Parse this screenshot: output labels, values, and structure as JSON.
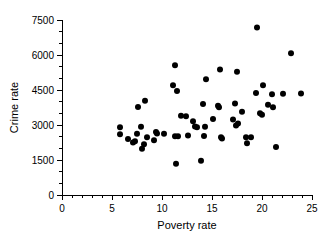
{
  "chart_data": {
    "type": "scatter",
    "title": "",
    "xlabel": "Poverty rate",
    "ylabel": "Crime rate",
    "xlim": [
      0,
      25
    ],
    "ylim": [
      0,
      7500
    ],
    "x_ticks": [
      0,
      5,
      10,
      15,
      20,
      25
    ],
    "y_ticks": [
      0,
      1500,
      3000,
      4500,
      6000,
      7500
    ],
    "x_tick_labels": [
      "0",
      "5",
      "10",
      "15",
      "20",
      "25"
    ],
    "y_tick_labels": [
      "0",
      "1500",
      "3000",
      "4500",
      "6000",
      "7500"
    ],
    "x_minor_tick_step": 1,
    "y_minor_tick_step": 500,
    "grid": false,
    "legend": false,
    "marker": "filled-circle",
    "marker_color": "#000000",
    "marker_size": 3,
    "points": [
      {
        "x": 5.8,
        "y": 2900
      },
      {
        "x": 5.8,
        "y": 2600
      },
      {
        "x": 6.6,
        "y": 2400
      },
      {
        "x": 7.1,
        "y": 2250
      },
      {
        "x": 7.3,
        "y": 2300
      },
      {
        "x": 7.5,
        "y": 2620
      },
      {
        "x": 7.6,
        "y": 3770
      },
      {
        "x": 7.9,
        "y": 2930
      },
      {
        "x": 8.0,
        "y": 1980
      },
      {
        "x": 8.2,
        "y": 2180
      },
      {
        "x": 8.3,
        "y": 4040
      },
      {
        "x": 8.5,
        "y": 2480
      },
      {
        "x": 9.2,
        "y": 2350
      },
      {
        "x": 9.4,
        "y": 2700
      },
      {
        "x": 9.5,
        "y": 2640
      },
      {
        "x": 10.2,
        "y": 2620
      },
      {
        "x": 11.1,
        "y": 4700
      },
      {
        "x": 11.3,
        "y": 5560
      },
      {
        "x": 11.3,
        "y": 2520
      },
      {
        "x": 11.4,
        "y": 1340
      },
      {
        "x": 11.5,
        "y": 4460
      },
      {
        "x": 11.6,
        "y": 2520
      },
      {
        "x": 11.9,
        "y": 3400
      },
      {
        "x": 12.4,
        "y": 3380
      },
      {
        "x": 12.6,
        "y": 2550
      },
      {
        "x": 13.1,
        "y": 3160
      },
      {
        "x": 13.3,
        "y": 2940
      },
      {
        "x": 13.5,
        "y": 2900
      },
      {
        "x": 13.9,
        "y": 1470
      },
      {
        "x": 14.1,
        "y": 3900
      },
      {
        "x": 14.2,
        "y": 2530
      },
      {
        "x": 14.3,
        "y": 2920
      },
      {
        "x": 14.4,
        "y": 4960
      },
      {
        "x": 15.1,
        "y": 3260
      },
      {
        "x": 15.6,
        "y": 3820
      },
      {
        "x": 15.7,
        "y": 3760
      },
      {
        "x": 15.8,
        "y": 5380
      },
      {
        "x": 15.9,
        "y": 2480
      },
      {
        "x": 16.0,
        "y": 2420
      },
      {
        "x": 17.1,
        "y": 3240
      },
      {
        "x": 17.3,
        "y": 3920
      },
      {
        "x": 17.4,
        "y": 2980
      },
      {
        "x": 17.5,
        "y": 5280
      },
      {
        "x": 17.6,
        "y": 3060
      },
      {
        "x": 18.0,
        "y": 3570
      },
      {
        "x": 18.4,
        "y": 2480
      },
      {
        "x": 18.5,
        "y": 2220
      },
      {
        "x": 18.9,
        "y": 2480
      },
      {
        "x": 19.4,
        "y": 4370
      },
      {
        "x": 19.5,
        "y": 7180
      },
      {
        "x": 19.8,
        "y": 3500
      },
      {
        "x": 20.0,
        "y": 3440
      },
      {
        "x": 20.1,
        "y": 4700
      },
      {
        "x": 20.6,
        "y": 3870
      },
      {
        "x": 21.0,
        "y": 4320
      },
      {
        "x": 21.1,
        "y": 3760
      },
      {
        "x": 21.4,
        "y": 2060
      },
      {
        "x": 22.1,
        "y": 4340
      },
      {
        "x": 22.9,
        "y": 6080
      },
      {
        "x": 23.9,
        "y": 4350
      }
    ]
  }
}
